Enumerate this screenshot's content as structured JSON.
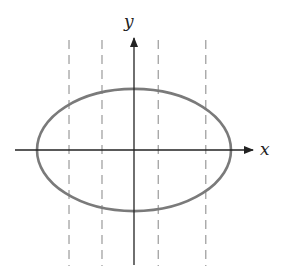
{
  "figure": {
    "axes": {
      "x_label": "x",
      "y_label": "y"
    },
    "ellipse": {
      "center": [
        0,
        0
      ],
      "semi_axis_x": 1.0,
      "semi_axis_y": 0.63
    },
    "dashed_lines_x": [
      -0.67,
      -0.33,
      0.25,
      0.74
    ],
    "colors": {
      "axis": "#222222",
      "ellipse": "#7a7a7a",
      "dashed": "#9a9a9a",
      "background": "#ffffff"
    }
  }
}
